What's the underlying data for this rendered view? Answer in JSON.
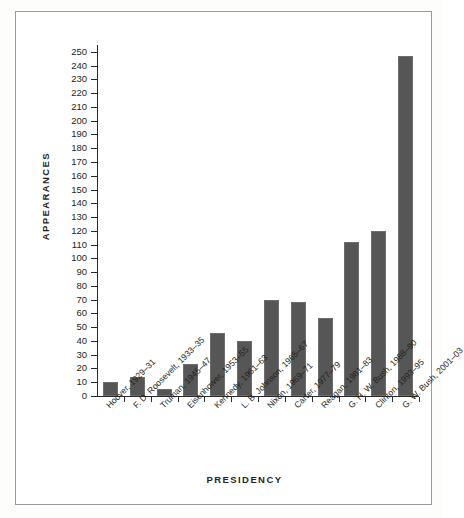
{
  "chart_data": {
    "type": "bar",
    "title": "",
    "xlabel": "PRESIDENCY",
    "ylabel": "APPEARANCES",
    "ylim": [
      0,
      255
    ],
    "ytick_step": 10,
    "yticks": [
      0,
      10,
      20,
      30,
      40,
      50,
      60,
      70,
      80,
      90,
      100,
      110,
      120,
      130,
      140,
      150,
      160,
      170,
      180,
      190,
      200,
      210,
      220,
      230,
      240,
      250
    ],
    "grid": false,
    "legend": null,
    "bar_color": "#565656",
    "axis_color": "#2b2b2b",
    "categories": [
      "Hoover, 1929–31",
      "F. D. Roosevelt, 1933–35",
      "Truman, 1945–47",
      "Eisenhower, 1953–55",
      "Kennedy, 1961–63",
      "L. B. Johnson, 1965–67",
      "Nixon, 1969–71",
      "Carter, 1977–79",
      "Reagan, 1981–83",
      "G. H. W. Bush, 1988–90",
      "Clinton, 1993–95",
      "G. W. Bush, 2001–03"
    ],
    "values": [
      10,
      14,
      5,
      23,
      46,
      40,
      70,
      68,
      57,
      112,
      120,
      247
    ]
  }
}
